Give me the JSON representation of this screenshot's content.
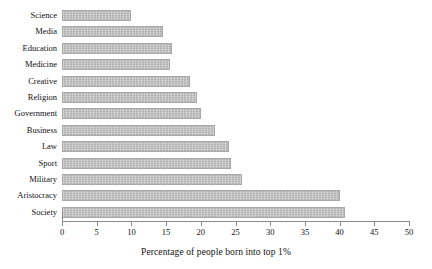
{
  "chart_data": {
    "type": "bar",
    "orientation": "horizontal",
    "title": "",
    "xlabel": "Percentage of people born into top 1%",
    "ylabel": "",
    "xlim": [
      0,
      50
    ],
    "xticks": [
      0,
      5,
      10,
      15,
      20,
      25,
      30,
      35,
      40,
      45,
      50
    ],
    "grid": false,
    "legend": false,
    "bar_color": "#bdbdbd",
    "categories": [
      "Science",
      "Media",
      "Education",
      "Medicine",
      "Creative",
      "Religion",
      "Government",
      "Business",
      "Law",
      "Sport",
      "Military",
      "Aristocracy",
      "Society"
    ],
    "values": [
      10,
      14.5,
      15.8,
      15.5,
      18.5,
      19.5,
      20,
      22,
      24,
      24.4,
      26,
      40,
      40.8
    ]
  }
}
